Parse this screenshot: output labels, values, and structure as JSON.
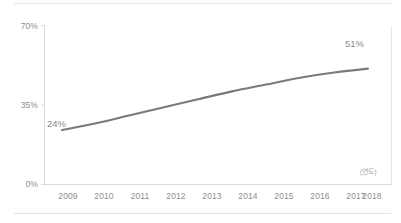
{
  "chart_data": {
    "type": "line",
    "title": "",
    "subtitle": "",
    "xlabel": "(연도)",
    "ylabel": "",
    "categories": [
      "2009",
      "2010",
      "2011",
      "2012",
      "2013",
      "2014",
      "2015",
      "2016",
      "2017",
      "2018"
    ],
    "x": [
      2009,
      2010,
      2011,
      2012,
      2013,
      2014,
      2015,
      2016,
      2017,
      2018
    ],
    "values": [
      24,
      27,
      30.5,
      34,
      37.5,
      41,
      44,
      47,
      49.3,
      51
    ],
    "series": [
      {
        "name": "",
        "values": [
          24,
          27,
          30.5,
          34,
          37.5,
          41,
          44,
          47,
          49.3,
          51
        ]
      }
    ],
    "ylim": [
      0,
      70
    ],
    "yticks": [
      0,
      35,
      70
    ],
    "ytick_labels": [
      "0%",
      "35%",
      "70%"
    ],
    "xtick_labels": [
      "2009",
      "2010",
      "2011",
      "2012",
      "2013",
      "2014",
      "2015",
      "2016",
      "2017",
      "2018"
    ],
    "annotations": [
      {
        "text": "24%",
        "x": 2009,
        "y": 24,
        "position": "above-left"
      },
      {
        "text": "51%",
        "x": 2018,
        "y": 51,
        "position": "above-left"
      }
    ],
    "grid": false,
    "legend": null,
    "legend_position": "none",
    "line_color": "#7a7a7a",
    "axis_color": "#d9d9d9",
    "text_color": "#8d8d8d",
    "background": "#ffffff"
  },
  "axis": {
    "y_labels": [
      "70%",
      "35%",
      "0%"
    ],
    "x_labels": [
      "2009",
      "2010",
      "2011",
      "2012",
      "2013",
      "2014",
      "2015",
      "2016",
      "2017",
      "2018"
    ],
    "unit_label": "(연도)"
  },
  "data_labels": {
    "start": "24%",
    "end": "51%"
  }
}
